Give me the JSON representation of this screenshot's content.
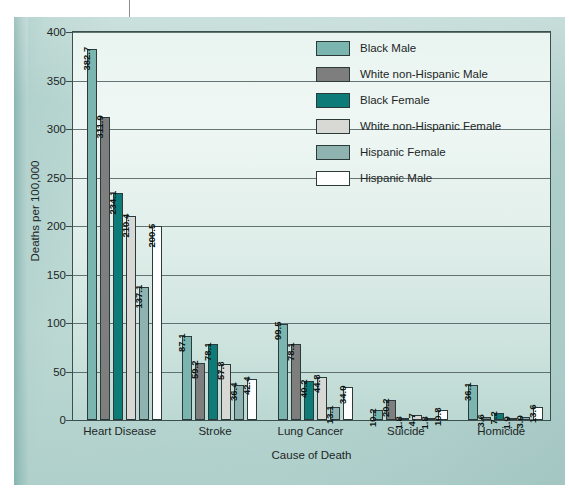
{
  "chart_data": {
    "type": "bar",
    "title": "",
    "xlabel": "Cause of Death",
    "ylabel": "Deaths per 100,000",
    "ylim": [
      0,
      400
    ],
    "yticks": [
      0,
      50,
      100,
      150,
      200,
      250,
      300,
      350,
      400
    ],
    "grid": true,
    "legend_position": "top-right",
    "categories": [
      "Heart Disease",
      "Stroke",
      "Lung Cancer",
      "Suicide",
      "Homicide"
    ],
    "series": [
      {
        "name": "Black Male",
        "color": "#7ab5b0",
        "values": [
          382.7,
          87.1,
          99.5,
          10.2,
          36.1
        ]
      },
      {
        "name": "White non-Hispanic Male",
        "color": "#7e7e7e",
        "values": [
          311.9,
          59.2,
          78.1,
          20.2,
          3.6
        ]
      },
      {
        "name": "Black Female",
        "color": "#0d7b78",
        "values": [
          234.1,
          78.1,
          40.2,
          1.8,
          7.2
        ]
      },
      {
        "name": "White non-Hispanic Female",
        "color": "#d8d8d4",
        "values": [
          210.4,
          57.8,
          44.8,
          4.7,
          1.9
        ]
      },
      {
        "name": "Hispanic Female",
        "color": "#8fb3b0",
        "values": [
          137.1,
          36.4,
          13.1,
          1.8,
          3.0
        ]
      },
      {
        "name": "Hispanic Male",
        "color": "#ffffff",
        "values": [
          200.5,
          42.4,
          34.0,
          10.8,
          13.6
        ]
      }
    ],
    "value_labels": {
      "Heart Disease": [
        "382.7",
        "311.9",
        "234.1",
        "210.4",
        "137.1",
        "200.5"
      ],
      "Stroke": [
        "87.1",
        "59.2",
        "78.1",
        "57.8",
        "36.4",
        "42.4"
      ],
      "Lung Cancer": [
        "99.5",
        "78.1",
        "40.2",
        "44.8",
        "13.1",
        "34.0"
      ],
      "Suicide": [
        "10.2",
        "20.2",
        "1.8",
        "4.7",
        "1.8",
        "10.8"
      ],
      "Homicide": [
        "36.1",
        "3.6",
        "7.2",
        "1.9",
        "3.0",
        "13.6"
      ]
    }
  },
  "legend": {
    "items": [
      {
        "label": "Black Male",
        "color": "#7ab5b0"
      },
      {
        "label": "White non-Hispanic Male",
        "color": "#7e7e7e"
      },
      {
        "label": "Black Female",
        "color": "#0d7b78"
      },
      {
        "label": "White non-Hispanic Female",
        "color": "#d8d8d4"
      },
      {
        "label": "Hispanic Female",
        "color": "#8fb3b0"
      },
      {
        "label": "Hispanic Male",
        "color": "#ffffff"
      }
    ]
  },
  "axes": {
    "y_title": "Deaths per 100,000",
    "x_title": "Cause of Death",
    "y_tick_labels": [
      "400",
      "350",
      "300",
      "250",
      "200",
      "150",
      "100",
      "50",
      "0"
    ],
    "x_tick_labels": [
      "Heart Disease",
      "Stroke",
      "Lung Cancer",
      "Suicide",
      "Homicide"
    ]
  },
  "palette": {
    "card_bg": "#b9d6d2",
    "plot_bg_top": "#eff7f4",
    "plot_bg_bottom": "#bcd8d2",
    "axis_line": "#3c4f4f",
    "grid_line": "#4b5e5d",
    "text": "#1d2626"
  }
}
